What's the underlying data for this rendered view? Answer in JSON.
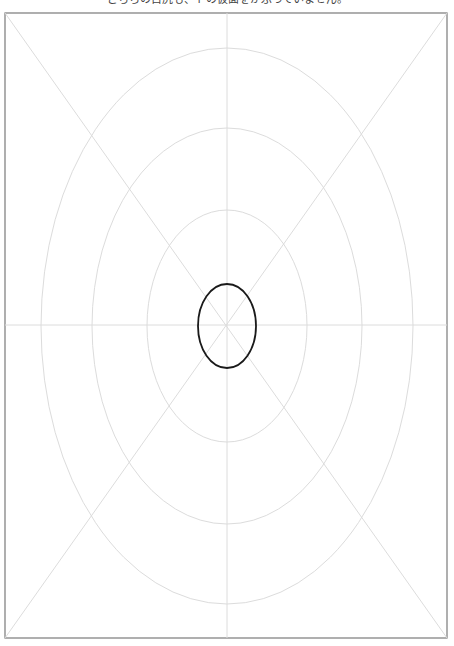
{
  "caption": "どちらの目尻も、トの仮面をかぶっていません。",
  "colors": {
    "frame": "#7a7a7a",
    "grid": "#dcdcdc",
    "target": "#1a1a1a",
    "background": "#ffffff"
  },
  "frame": {
    "x": 5,
    "y": 13,
    "width": 442,
    "height": 625
  },
  "center": {
    "x": 227,
    "y": 326
  },
  "grid_rings": [
    {
      "rx": 80,
      "ry": 116
    },
    {
      "rx": 135,
      "ry": 198
    },
    {
      "rx": 186,
      "ry": 278
    }
  ],
  "target_ellipse": {
    "rx": 29,
    "ry": 42
  }
}
